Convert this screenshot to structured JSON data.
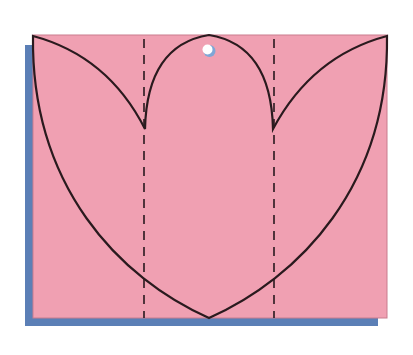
{
  "diagram": {
    "colors": {
      "background": "#ffffff",
      "card_fill": "#f0a0b2",
      "card_edge": "#c97d8e",
      "shadow": "#5b7fb6",
      "outline": "#2a1a1e",
      "hole_fill": "#ffffff",
      "hole_shade": "#7fa6d6"
    },
    "card": {
      "x": 33,
      "y": 35,
      "width": 354,
      "height": 283
    },
    "shadow": {
      "x": 25,
      "y": 45,
      "width": 353,
      "height": 281
    },
    "fold_lines": [
      {
        "name": "left-fold",
        "x": 144,
        "style": "dashed"
      },
      {
        "name": "right-fold",
        "x": 274,
        "style": "dashed"
      }
    ],
    "hole": {
      "cx": 208,
      "cy": 50,
      "r": 6
    },
    "tulip_outline": {
      "top_center": [
        209,
        35
      ],
      "left_tip": [
        145,
        129
      ],
      "right_tip": [
        273,
        129
      ],
      "top_left_corner": [
        33,
        36
      ],
      "top_right_corner": [
        387,
        36
      ],
      "bottom_point": [
        209,
        318
      ]
    }
  }
}
